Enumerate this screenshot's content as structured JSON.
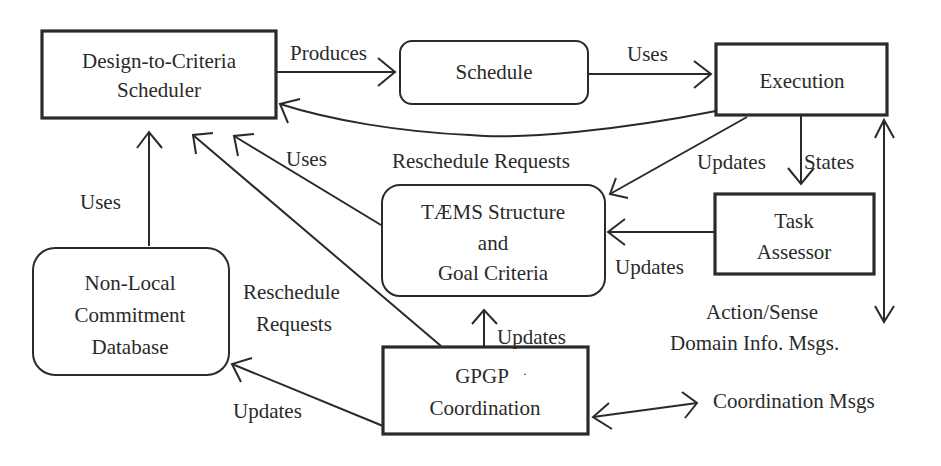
{
  "diagram": {
    "nodes": [
      {
        "id": "scheduler",
        "shape": "rect",
        "lines": [
          "Design-to-Criteria",
          "Scheduler"
        ]
      },
      {
        "id": "schedule",
        "shape": "rounded",
        "lines": [
          "Schedule"
        ]
      },
      {
        "id": "execution",
        "shape": "rect",
        "lines": [
          "Execution"
        ]
      },
      {
        "id": "taems",
        "shape": "rounded",
        "lines": [
          "TÆMS Structure",
          "and",
          "Goal Criteria"
        ]
      },
      {
        "id": "assessor",
        "shape": "rect",
        "lines": [
          "Task",
          "Assessor"
        ]
      },
      {
        "id": "nonlocal",
        "shape": "rounded",
        "lines": [
          "Non-Local",
          "Commitment",
          "Database"
        ]
      },
      {
        "id": "gpgp",
        "shape": "rect",
        "lines": [
          "GPGP",
          "Coordination"
        ]
      }
    ],
    "edges": [
      {
        "id": "produces",
        "from": "scheduler",
        "to": "schedule",
        "label": "Produces"
      },
      {
        "id": "uses-schedule",
        "from": "schedule",
        "to": "execution",
        "label": "Uses"
      },
      {
        "id": "reschedule-exec",
        "from": "execution",
        "to": "scheduler",
        "label": ""
      },
      {
        "id": "updates-exec-taems",
        "from": "execution",
        "to": "taems",
        "label": "Reschedule Requests"
      },
      {
        "id": "states",
        "from": "execution",
        "to": "assessor",
        "label": "States"
      },
      {
        "id": "updates-exec-label",
        "from": "execution",
        "to": "taems",
        "label": "Updates"
      },
      {
        "id": "updates-assessor",
        "from": "assessor",
        "to": "taems",
        "label": "Updates"
      },
      {
        "id": "uses-taems",
        "from": "taems",
        "to": "scheduler",
        "label": "Uses"
      },
      {
        "id": "uses-nonlocal",
        "from": "nonlocal",
        "to": "scheduler",
        "label": "Uses"
      },
      {
        "id": "reschedule-gpgp",
        "from": "gpgp",
        "to": "scheduler",
        "label": "Reschedule Requests"
      },
      {
        "id": "updates-gpgp-taems",
        "from": "gpgp",
        "to": "taems",
        "label": "Updates"
      },
      {
        "id": "updates-gpgp-nonlocal",
        "from": "gpgp",
        "to": "nonlocal",
        "label": "Updates"
      },
      {
        "id": "action-sense",
        "from": "execution",
        "to": "external",
        "label": "Action/Sense Domain Info. Msgs."
      },
      {
        "id": "coordination-msgs",
        "from": "gpgp",
        "to": "external",
        "label": "Coordination Msgs"
      }
    ],
    "labels": {
      "produces": "Produces",
      "uses_schedule": "Uses",
      "uses_taems": "Uses",
      "uses_nonlocal": "Uses",
      "reschedule_requests_top": "Reschedule Requests",
      "updates_exec": "Updates",
      "states": "States",
      "updates_assessor": "Updates",
      "reschedule_gpgp_1": "Reschedule",
      "reschedule_gpgp_2": "Requests",
      "updates_gpgp_taems": "Updates",
      "updates_gpgp_nonlocal": "Updates",
      "action_sense_1": "Action/Sense",
      "action_sense_2": "Domain Info. Msgs.",
      "coordination_msgs": "Coordination Msgs",
      "gpgp_dot": "·"
    }
  }
}
